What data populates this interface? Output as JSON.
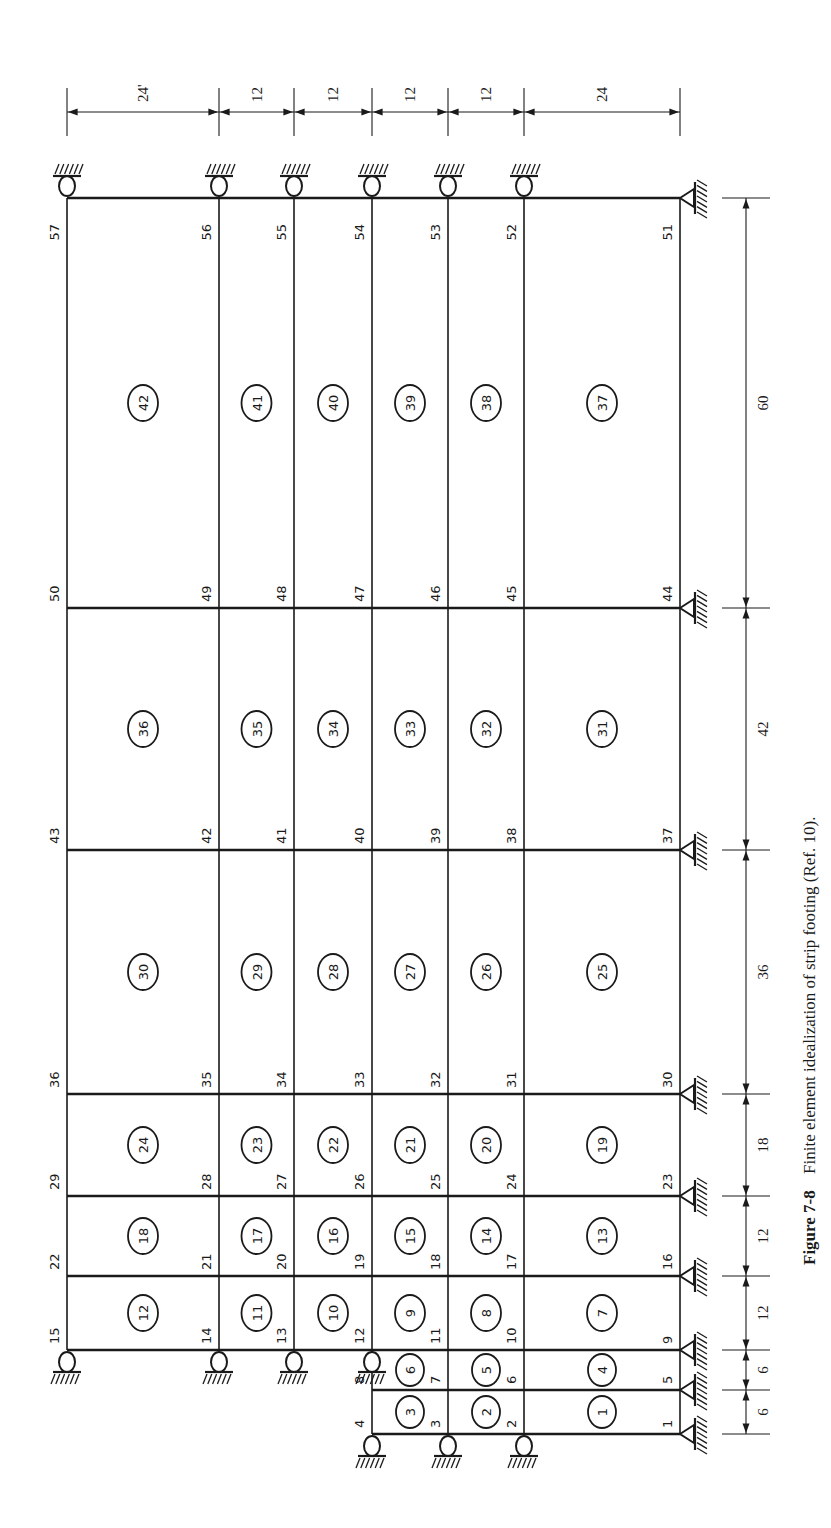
{
  "figure": {
    "caption_label": "Figure 7-8",
    "caption_text": "Finite element idealization of strip footing (Ref. 10)."
  },
  "mesh": {
    "columns_x": [
      67,
      219,
      294,
      372,
      448,
      524,
      680
    ],
    "rows_y": [
      198,
      608,
      850,
      1094,
      1196,
      1276,
      1350,
      1390,
      1434
    ],
    "node_rows": [
      {
        "y_index": 0,
        "nodes": [
          "57",
          "56",
          "55",
          "54",
          "53",
          "52",
          "51"
        ]
      },
      {
        "y_index": 1,
        "nodes": [
          "50",
          "49",
          "48",
          "47",
          "46",
          "45",
          "44"
        ]
      },
      {
        "y_index": 2,
        "nodes": [
          "43",
          "42",
          "41",
          "40",
          "39",
          "38",
          "37"
        ]
      },
      {
        "y_index": 3,
        "nodes": [
          "36",
          "35",
          "34",
          "33",
          "32",
          "31",
          "30"
        ]
      },
      {
        "y_index": 4,
        "nodes": [
          "29",
          "28",
          "27",
          "26",
          "25",
          "24",
          "23"
        ]
      },
      {
        "y_index": 5,
        "nodes": [
          "22",
          "21",
          "20",
          "19",
          "18",
          "17",
          "16"
        ]
      },
      {
        "y_index": 6,
        "nodes": [
          "15",
          "14",
          "13",
          "12",
          "11",
          "10",
          "9"
        ]
      },
      {
        "y_index": 7,
        "nodes": [
          "",
          "",
          "",
          "8",
          "7",
          "6",
          "5"
        ]
      },
      {
        "y_index": 8,
        "nodes": [
          "",
          "",
          "",
          "4",
          "3",
          "2",
          "1"
        ]
      }
    ],
    "element_rows": [
      {
        "band": 0,
        "elements": [
          "42",
          "41",
          "40",
          "39",
          "38",
          "37"
        ]
      },
      {
        "band": 1,
        "elements": [
          "36",
          "35",
          "34",
          "33",
          "32",
          "31"
        ]
      },
      {
        "band": 2,
        "elements": [
          "30",
          "29",
          "28",
          "27",
          "26",
          "25"
        ]
      },
      {
        "band": 3,
        "elements": [
          "24",
          "23",
          "22",
          "21",
          "20",
          "19"
        ]
      },
      {
        "band": 4,
        "elements": [
          "18",
          "17",
          "16",
          "15",
          "14",
          "13"
        ]
      },
      {
        "band": 5,
        "elements": [
          "12",
          "11",
          "10",
          "9",
          "8",
          "7"
        ]
      },
      {
        "band": 6,
        "elements": [
          "",
          "",
          "",
          "6",
          "5",
          "4"
        ]
      },
      {
        "band": 7,
        "elements": [
          "",
          "",
          "",
          "3",
          "2",
          "1"
        ]
      }
    ]
  },
  "dimensions": {
    "top": {
      "labels": [
        "24'",
        "12",
        "12",
        "12",
        "12",
        "24"
      ]
    },
    "right": {
      "labels": [
        "60",
        "42",
        "36",
        "18",
        "12",
        "12",
        "6",
        "6"
      ]
    }
  },
  "supports": {
    "roller_nodes": [
      "57",
      "56",
      "55",
      "54",
      "53",
      "52",
      "15",
      "14",
      "13",
      "12",
      "4",
      "3",
      "2"
    ],
    "pin_nodes": [
      "51",
      "44",
      "37",
      "30",
      "23",
      "16",
      "9",
      "5",
      "1"
    ]
  }
}
